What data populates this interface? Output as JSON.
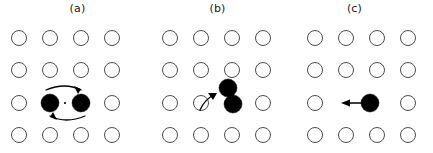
{
  "figure": {
    "width": 433,
    "height": 153,
    "background_color": "#ffffff",
    "site_color": "#ffffff",
    "site_stroke_color": "#4d4d4d",
    "atom_color": "#000000",
    "arrow_color": "#000000"
  },
  "panels": [
    {
      "id": "a",
      "label": "(a)",
      "mechanism_name": "exchange-rotation",
      "lattice": {
        "columns": 4,
        "rows": 4,
        "x_positions": [
          19,
          50,
          81,
          112
        ],
        "y_positions": [
          38,
          70,
          103,
          135
        ],
        "site_radius": 7.5
      },
      "open_sites": [
        {
          "col": 1,
          "row": 1
        },
        {
          "col": 2,
          "row": 1
        },
        {
          "col": 3,
          "row": 1
        },
        {
          "col": 4,
          "row": 1
        },
        {
          "col": 1,
          "row": 2
        },
        {
          "col": 2,
          "row": 2
        },
        {
          "col": 3,
          "row": 2
        },
        {
          "col": 4,
          "row": 2
        },
        {
          "col": 1,
          "row": 3
        },
        {
          "col": 4,
          "row": 3
        },
        {
          "col": 1,
          "row": 4
        },
        {
          "col": 2,
          "row": 4
        },
        {
          "col": 3,
          "row": 4
        },
        {
          "col": 4,
          "row": 4
        }
      ],
      "atoms": [
        {
          "cx": 50,
          "cy": 103,
          "r": 9
        },
        {
          "cx": 81,
          "cy": 103,
          "r": 9
        }
      ],
      "pivot": {
        "cx": 65,
        "cy": 103,
        "r": 1.1
      },
      "arrows": [
        {
          "type": "arc",
          "direction": "clockwise-top",
          "description": "top arc sweeping to the right"
        },
        {
          "type": "arc",
          "direction": "clockwise-bottom",
          "description": "bottom arc sweeping to the left"
        }
      ]
    },
    {
      "id": "b",
      "label": "(b)",
      "mechanism_name": "dumbbell-interstitial",
      "lattice": {
        "columns": 4,
        "rows": 4,
        "x_positions": [
          25,
          56,
          87,
          118
        ],
        "y_positions": [
          38,
          70,
          103,
          135
        ],
        "site_radius": 7.5
      },
      "open_sites": [
        {
          "col": 1,
          "row": 1
        },
        {
          "col": 2,
          "row": 1
        },
        {
          "col": 3,
          "row": 1
        },
        {
          "col": 4,
          "row": 1
        },
        {
          "col": 1,
          "row": 2
        },
        {
          "col": 2,
          "row": 2
        },
        {
          "col": 3,
          "row": 2
        },
        {
          "col": 4,
          "row": 2
        },
        {
          "col": 1,
          "row": 3
        },
        {
          "col": 2,
          "row": 3
        },
        {
          "col": 4,
          "row": 3
        },
        {
          "col": 1,
          "row": 4
        },
        {
          "col": 2,
          "row": 4
        },
        {
          "col": 3,
          "row": 4
        },
        {
          "col": 4,
          "row": 4
        }
      ],
      "atoms": [
        {
          "cx": 83,
          "cy": 88,
          "r": 9
        },
        {
          "cx": 88,
          "cy": 104,
          "r": 9
        }
      ],
      "arrows": [
        {
          "type": "curve",
          "direction": "up-right",
          "description": "curved arrow approaching from lower left"
        }
      ]
    },
    {
      "id": "c",
      "label": "(c)",
      "mechanism_name": "vacancy-migration",
      "lattice": {
        "columns": 4,
        "rows": 4,
        "x_positions": [
          27,
          58,
          89,
          120
        ],
        "y_positions": [
          38,
          70,
          103,
          135
        ],
        "site_radius": 7.5
      },
      "open_sites": [
        {
          "col": 1,
          "row": 1
        },
        {
          "col": 2,
          "row": 1
        },
        {
          "col": 3,
          "row": 1
        },
        {
          "col": 4,
          "row": 1
        },
        {
          "col": 1,
          "row": 2
        },
        {
          "col": 2,
          "row": 2
        },
        {
          "col": 3,
          "row": 2
        },
        {
          "col": 4,
          "row": 2
        },
        {
          "col": 1,
          "row": 3
        },
        {
          "col": 4,
          "row": 3
        },
        {
          "col": 1,
          "row": 4
        },
        {
          "col": 2,
          "row": 4
        },
        {
          "col": 3,
          "row": 4
        },
        {
          "col": 4,
          "row": 4
        }
      ],
      "atoms": [
        {
          "cx": 82,
          "cy": 103,
          "r": 9
        }
      ],
      "arrows": [
        {
          "type": "straight",
          "direction": "left",
          "description": "straight arrow pointing left from the atom"
        }
      ]
    }
  ]
}
